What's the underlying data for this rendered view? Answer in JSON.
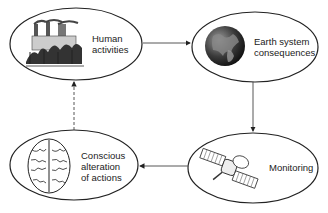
{
  "diagram": {
    "type": "cycle",
    "nodes": [
      {
        "id": "human",
        "label_lines": [
          "Human",
          "activities"
        ],
        "icon": "factory-icon"
      },
      {
        "id": "earth",
        "label_lines": [
          "Earth system",
          "consequences"
        ],
        "icon": "globe-icon"
      },
      {
        "id": "monitoring",
        "label_lines": [
          "Monitoring"
        ],
        "icon": "satellite-icon"
      },
      {
        "id": "conscious",
        "label_lines": [
          "Conscious",
          "alteration",
          "of actions"
        ],
        "icon": "brain-icon"
      }
    ],
    "edges": [
      {
        "from": "human",
        "to": "earth",
        "style": "solid"
      },
      {
        "from": "earth",
        "to": "monitoring",
        "style": "solid"
      },
      {
        "from": "monitoring",
        "to": "conscious",
        "style": "solid"
      },
      {
        "from": "conscious",
        "to": "human",
        "style": "dashed"
      }
    ]
  }
}
